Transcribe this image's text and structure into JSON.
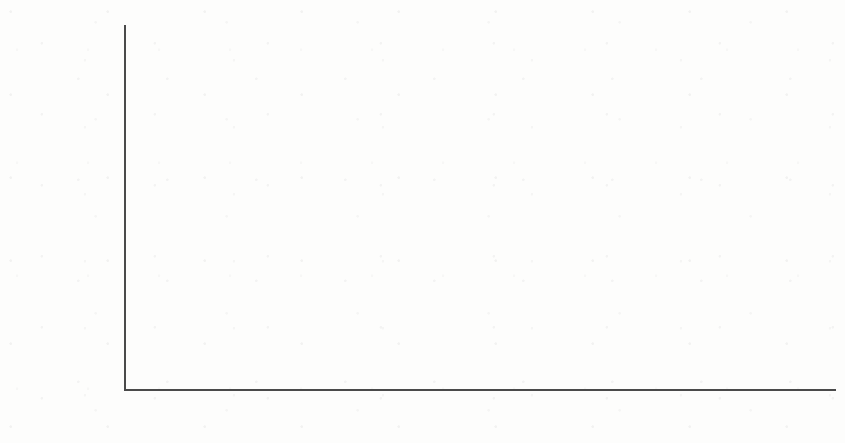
{
  "chart_data": {
    "type": "bar",
    "title": "",
    "subtitle": "",
    "xlabel": "",
    "ylabel": "Exportüberschuss in Mrd. €",
    "categories": [
      "2002",
      "2003",
      "2004",
      "2005",
      "2006",
      "2007",
      "2008",
      "2009",
      "2010"
    ],
    "values": [
      2.5,
      7.2,
      9.0,
      10.4,
      12.9,
      15.3,
      19.3,
      16.7,
      18.3
    ],
    "unit": "Mrd. €",
    "ylim": [
      0,
      19.8
    ],
    "y_major_ticks": [
      "0",
      "5",
      "10",
      "15"
    ],
    "y_major_tick_values": [
      0,
      5,
      10,
      15
    ],
    "y_minor_tick_step": 1,
    "grid": false,
    "legend": null,
    "legend_position": "none",
    "annotations": [],
    "bar_color": "#8b8b8b",
    "axis_color": "#4a4a4a",
    "text_color": "#1d1d1d",
    "background_color": "#fdfdfc"
  },
  "figure": {
    "plot_left_px": 124,
    "plot_right_px": 836,
    "baseline_px": 389,
    "top_px": 25,
    "bar_width_px": 63,
    "bar_gap_px": 16
  }
}
